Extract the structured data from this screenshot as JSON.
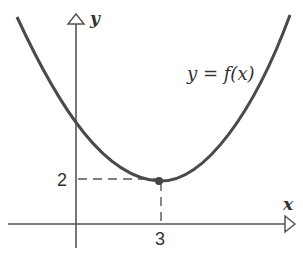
{
  "diagram": {
    "title": "",
    "axes": {
      "x_label": "x",
      "y_label": "y"
    },
    "curve_label": "y = f(x)",
    "minimum_point": {
      "x": 3,
      "y": 2
    },
    "ticks": {
      "x_tick": "3",
      "y_tick": "2"
    },
    "colors": {
      "curve": "#4a4a4a",
      "axes": "#555555",
      "background": "#ffffff"
    }
  }
}
